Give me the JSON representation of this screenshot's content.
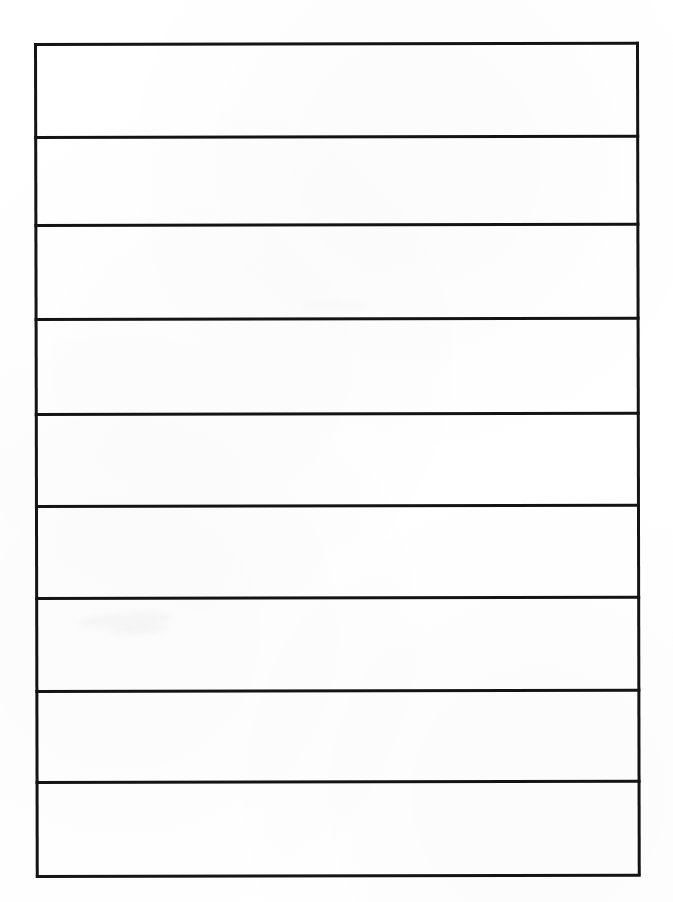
{
  "document": {
    "kind": "scanned-blank-form",
    "title": "",
    "page_width": 673,
    "page_height": 902,
    "background_color": "#ffffff",
    "ink_color": "#141414",
    "visible_text": "",
    "notes": "No printed text, labels, numbers or marks are legible anywhere on the page."
  },
  "table": {
    "name": "blank-ruled-form",
    "left": 34,
    "top": 43,
    "width": 605,
    "height": 833,
    "border_width_px": 3,
    "column_count": 1,
    "row_count": 9,
    "skew_degrees": -0.12,
    "horizontal_rule_y": [
      0,
      93,
      181,
      275,
      370,
      462,
      554,
      647,
      738,
      832
    ],
    "rows": [
      {
        "index": 1,
        "top": 0,
        "height": 93,
        "content": ""
      },
      {
        "index": 2,
        "top": 93,
        "height": 88,
        "content": ""
      },
      {
        "index": 3,
        "top": 181,
        "height": 94,
        "content": ""
      },
      {
        "index": 4,
        "top": 275,
        "height": 95,
        "content": ""
      },
      {
        "index": 5,
        "top": 370,
        "height": 92,
        "content": ""
      },
      {
        "index": 6,
        "top": 462,
        "height": 92,
        "content": ""
      },
      {
        "index": 7,
        "top": 554,
        "height": 93,
        "content": ""
      },
      {
        "index": 8,
        "top": 647,
        "height": 91,
        "content": ""
      },
      {
        "index": 9,
        "top": 738,
        "height": 94,
        "content": ""
      }
    ]
  }
}
